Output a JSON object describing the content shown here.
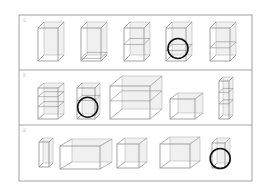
{
  "frame": {
    "x": 19,
    "y": 15,
    "w": 233,
    "h": 166,
    "stroke": "#8a8a8a"
  },
  "dividers": [
    70,
    125
  ],
  "rows": [
    {
      "label": "①",
      "label_pos": [
        22,
        17
      ],
      "boxes": [
        {
          "x": 38,
          "y": 28,
          "w": 20,
          "h": 33,
          "dx": 6,
          "dy": -6,
          "shelves": [],
          "circled": false
        },
        {
          "x": 81,
          "y": 28,
          "w": 20,
          "h": 33,
          "dx": 6,
          "dy": -6,
          "shelves": [
            0.92
          ],
          "circled": false
        },
        {
          "x": 124,
          "y": 28,
          "w": 20,
          "h": 33,
          "dx": 6,
          "dy": -6,
          "shelves": [
            0.5
          ],
          "circled": false
        },
        {
          "x": 166,
          "y": 28,
          "w": 20,
          "h": 33,
          "dx": 6,
          "dy": -6,
          "shelves": [
            0.68
          ],
          "circled": true
        },
        {
          "x": 210,
          "y": 28,
          "w": 20,
          "h": 33,
          "dx": 6,
          "dy": -6,
          "shelves": [
            0.6
          ],
          "circled": false
        }
      ]
    },
    {
      "label": "②",
      "label_pos": [
        22,
        72
      ],
      "boxes": [
        {
          "x": 38,
          "y": 88,
          "w": 20,
          "h": 31,
          "dx": 6,
          "dy": -5,
          "shelves": [
            0.28,
            0.6
          ],
          "circled": false
        },
        {
          "x": 77,
          "y": 88,
          "w": 18,
          "h": 31,
          "dx": 5,
          "dy": -5,
          "shelves": [
            0.4
          ],
          "circled": true
        },
        {
          "x": 110,
          "y": 86,
          "w": 40,
          "h": 33,
          "dx": 12,
          "dy": -10,
          "shelves": [
            0.45
          ],
          "circled": false
        },
        {
          "x": 170,
          "y": 99,
          "w": 25,
          "h": 20,
          "dx": 8,
          "dy": -6,
          "shelves": [],
          "circled": false
        },
        {
          "x": 219,
          "y": 81,
          "w": 10,
          "h": 38,
          "dx": 4,
          "dy": -4,
          "shelves": [
            0.3,
            0.6
          ],
          "circled": false
        }
      ]
    },
    {
      "label": "③",
      "label_pos": [
        22,
        127
      ],
      "boxes": [
        {
          "x": 39,
          "y": 142,
          "w": 10,
          "h": 25,
          "dx": 4,
          "dy": -4,
          "shelves": [],
          "circled": false
        },
        {
          "x": 60,
          "y": 146,
          "w": 40,
          "h": 23,
          "dx": 12,
          "dy": -7,
          "shelves": [],
          "circled": false
        },
        {
          "x": 117,
          "y": 144,
          "w": 22,
          "h": 24,
          "dx": 8,
          "dy": -6,
          "shelves": [],
          "circled": false
        },
        {
          "x": 160,
          "y": 144,
          "w": 30,
          "h": 24,
          "dx": 10,
          "dy": -7,
          "shelves": [],
          "circled": false
        },
        {
          "x": 212,
          "y": 143,
          "w": 13,
          "h": 25,
          "dx": 5,
          "dy": -5,
          "shelves": [],
          "circled": true
        }
      ]
    }
  ],
  "circle": {
    "r": 10,
    "stroke": "#111111",
    "stroke_width": 1.6
  },
  "box_style": {
    "stroke": "#8c8c8c",
    "fill": "#f0f0f0",
    "hidden_stroke": "#b5b5b5"
  }
}
